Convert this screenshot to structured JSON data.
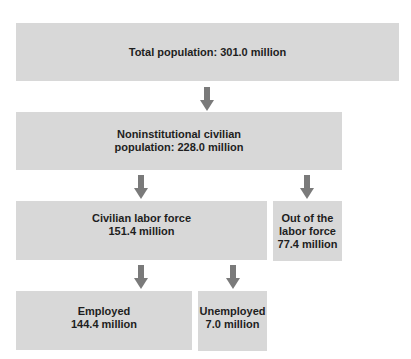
{
  "diagram": {
    "type": "hierarchy-flow",
    "colors": {
      "box_fill": "#d8d8d8",
      "arrow": "#7a7a7a",
      "text": "#1e1e1e",
      "background": "#ffffff"
    },
    "nodes": {
      "total_population": {
        "label": "Total population: 301.0 million",
        "category": "Total population",
        "value": "301.0 million"
      },
      "noninstitutional": {
        "line1": "Noninstitutional civilian",
        "line2": "population: 228.0 million",
        "category": "Noninstitutional civilian population",
        "value": "228.0 million"
      },
      "civilian_labor_force": {
        "line1": "Civilian labor force",
        "line2": "151.4 million",
        "value": "151.4 million"
      },
      "out_of_labor_force": {
        "line1": "Out of the",
        "line2": "labor force",
        "line3": "77.4 million",
        "value": "77.4 million"
      },
      "employed": {
        "line1": "Employed",
        "line2": "144.4 million",
        "value": "144.4 million"
      },
      "unemployed": {
        "line1": "Unemployed",
        "line2": "7.0 million",
        "value": "7.0 million"
      }
    },
    "edges": [
      {
        "from": "total_population",
        "to": "noninstitutional"
      },
      {
        "from": "noninstitutional",
        "to": "civilian_labor_force"
      },
      {
        "from": "noninstitutional",
        "to": "out_of_labor_force"
      },
      {
        "from": "civilian_labor_force",
        "to": "employed"
      },
      {
        "from": "civilian_labor_force",
        "to": "unemployed"
      }
    ]
  }
}
